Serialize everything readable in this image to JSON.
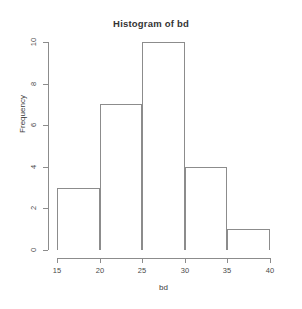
{
  "chart_data": {
    "type": "bar",
    "title": "Histogram of bd",
    "xlabel": "bd",
    "ylabel": "Frequency",
    "categories": [
      "15-20",
      "20-25",
      "25-30",
      "30-35",
      "35-40"
    ],
    "bin_edges": [
      15,
      20,
      25,
      30,
      35,
      40
    ],
    "values": [
      3,
      7,
      10,
      4,
      1
    ],
    "xlim": [
      15,
      40
    ],
    "ylim": [
      0,
      10
    ],
    "xticks": [
      15,
      20,
      25,
      30,
      35,
      40
    ],
    "yticks": [
      0,
      2,
      4,
      6,
      8,
      10
    ],
    "xtick_labels": [
      "15",
      "20",
      "25",
      "30",
      "35",
      "40"
    ],
    "ytick_labels": [
      "0",
      "2",
      "4",
      "6",
      "8",
      "10"
    ],
    "grid": false,
    "legend": false,
    "bar_fill": "#ffffff",
    "bar_border": "#8c8c8c",
    "background": "#ffffff",
    "text_color": "#3c3c3c"
  }
}
